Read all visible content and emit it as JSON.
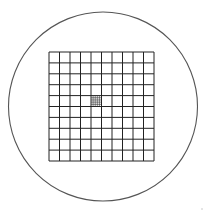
{
  "diagram": {
    "type": "reticle-grid",
    "colors": {
      "background": "#ffffff",
      "circle_stroke": "#555555",
      "grid_stroke": "#222222",
      "fine_grid_stroke": "#333333"
    },
    "circle": {
      "cx": 103,
      "cy": 106.5,
      "r": 94.5
    },
    "grid": {
      "x": 49,
      "y": 52,
      "width": 105,
      "height": 109,
      "cols": 10,
      "rows": 10
    },
    "center_cell": {
      "col": 4,
      "row": 4,
      "subdivisions": 5
    }
  }
}
